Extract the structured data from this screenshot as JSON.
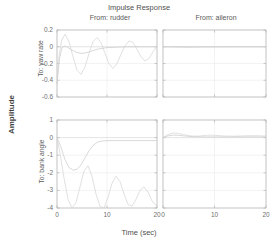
{
  "chart_data": {
    "type": "line",
    "title": "Impulse Response",
    "xlabel": "Time (sec)",
    "ylabel": "Amplitude",
    "grid": true,
    "legend": "none",
    "layout": "2x2 grid of subplots (MATLAB impulse response matrix)",
    "column_headers": [
      "From: rudder",
      "From: aileron"
    ],
    "row_headers": [
      "To: yaw rate",
      "To: bank angle"
    ],
    "xlim": [
      0,
      20
    ],
    "xticks": [
      "0",
      "10",
      "20"
    ],
    "xtick_values": [
      0,
      10,
      20
    ],
    "subplots": [
      {
        "row_label": "To: yaw rate",
        "col_label": "From: rudder",
        "ylim": [
          -0.6,
          0.2
        ],
        "yticks": [
          "0.2",
          "0",
          "-0.2",
          "-0.4",
          "-0.6"
        ],
        "ytick_values": [
          0.2,
          0,
          -0.2,
          -0.4,
          -0.6
        ],
        "series": [
          {
            "name": "dutch-roll-oscillatory",
            "x": [
              0,
              0.4,
              0.9,
              1.6,
              2.4,
              3.2,
              4.0,
              4.8,
              5.6,
              6.4,
              7.2,
              8.0,
              8.8,
              9.6,
              10.4,
              11.2,
              12.0,
              12.8,
              13.6,
              14.4,
              15.2,
              16.0,
              16.8,
              17.6,
              18.4,
              19.2,
              20.0
            ],
            "y": [
              -0.44,
              -0.12,
              0.07,
              0.15,
              0.06,
              -0.12,
              -0.28,
              -0.33,
              -0.24,
              -0.08,
              0.06,
              0.11,
              0.05,
              -0.08,
              -0.2,
              -0.26,
              -0.2,
              -0.09,
              0.01,
              0.07,
              0.05,
              -0.03,
              -0.12,
              -0.17,
              -0.14,
              -0.06,
              0.0
            ]
          },
          {
            "name": "damped-settling",
            "x": [
              0,
              0.5,
              1.0,
              1.6,
              2.2,
              3.0,
              4.0,
              5.0,
              6.0,
              7.0,
              8.0,
              9.0,
              10.0,
              12.0,
              14.0,
              16.0,
              18.0,
              20.0
            ],
            "y": [
              -0.44,
              -0.14,
              -0.01,
              0.01,
              -0.01,
              -0.04,
              -0.07,
              -0.08,
              -0.07,
              -0.05,
              -0.03,
              -0.02,
              -0.01,
              -0.005,
              0.0,
              0.0,
              0.0,
              0.0
            ]
          }
        ]
      },
      {
        "row_label": "To: yaw rate",
        "col_label": "From: aileron",
        "ylim": [
          -0.6,
          0.2
        ],
        "yticks": [
          "0.2",
          "0",
          "-0.2",
          "-0.4",
          "-0.6"
        ],
        "ytick_values": [
          0.2,
          0,
          -0.2,
          -0.4,
          -0.6
        ],
        "series": [
          {
            "name": "near-zero-response",
            "x": [
              0,
              2,
              4,
              6,
              8,
              10,
              12,
              14,
              16,
              18,
              20
            ],
            "y": [
              0.0,
              -0.005,
              -0.008,
              -0.006,
              -0.003,
              -0.002,
              -0.001,
              0.0,
              0.0,
              0.0,
              0.0
            ]
          },
          {
            "name": "near-zero-response-2",
            "x": [
              0,
              2,
              4,
              6,
              8,
              10,
              12,
              14,
              16,
              18,
              20
            ],
            "y": [
              0.0,
              0.002,
              0.001,
              0.0,
              0.0,
              0.0,
              0.0,
              0.0,
              0.0,
              0.0,
              0.0
            ]
          }
        ]
      },
      {
        "row_label": "To: bank angle",
        "col_label": "From: rudder",
        "ylim": [
          -4,
          1
        ],
        "yticks": [
          "1",
          "0",
          "-1",
          "-2",
          "-3",
          "-4"
        ],
        "ytick_values": [
          1,
          0,
          -1,
          -2,
          -3,
          -4
        ],
        "series": [
          {
            "name": "large-oscillation",
            "x": [
              0,
              0.6,
              1.4,
              2.2,
              3.0,
              3.8,
              4.6,
              5.4,
              6.2,
              7.0,
              7.8,
              8.6,
              9.4,
              10.2,
              11.0,
              11.8,
              12.6,
              13.4,
              14.2,
              15.0,
              15.8,
              16.6,
              17.4,
              18.2,
              19.0,
              20.0
            ],
            "y": [
              0.0,
              -0.9,
              -2.3,
              -3.5,
              -4.0,
              -3.7,
              -2.8,
              -1.9,
              -1.6,
              -2.2,
              -3.2,
              -3.9,
              -4.0,
              -3.4,
              -2.6,
              -2.2,
              -2.5,
              -3.2,
              -3.8,
              -3.9,
              -3.5,
              -3.0,
              -2.8,
              -3.1,
              -3.6,
              -3.9
            ]
          },
          {
            "name": "settling-response",
            "x": [
              0,
              0.8,
              1.6,
              2.4,
              3.2,
              4.0,
              4.8,
              5.6,
              6.4,
              7.2,
              8.0,
              8.8,
              9.6,
              10.4,
              12.0,
              14.0,
              16.0,
              18.0,
              20.0
            ],
            "y": [
              0.0,
              -0.55,
              -1.25,
              -1.7,
              -1.85,
              -1.8,
              -1.55,
              -1.15,
              -0.75,
              -0.45,
              -0.27,
              -0.2,
              -0.18,
              -0.17,
              -0.17,
              -0.17,
              -0.17,
              -0.17,
              -0.17
            ]
          }
        ]
      },
      {
        "row_label": "To: bank angle",
        "col_label": "From: aileron",
        "ylim": [
          -4,
          1
        ],
        "yticks": [
          "1",
          "0",
          "-1",
          "-2",
          "-3",
          "-4"
        ],
        "ytick_values": [
          1,
          0,
          -1,
          -2,
          -3,
          -4
        ],
        "series": [
          {
            "name": "small-positive-response",
            "x": [
              0,
              1,
              2,
              3,
              4,
              5,
              6,
              7,
              8,
              9,
              10,
              12,
              14,
              16,
              18,
              20
            ],
            "y": [
              0.0,
              0.18,
              0.26,
              0.24,
              0.17,
              0.11,
              0.08,
              0.09,
              0.12,
              0.14,
              0.13,
              0.09,
              0.08,
              0.1,
              0.11,
              0.09
            ]
          },
          {
            "name": "small-positive-response-2",
            "x": [
              0,
              1,
              2,
              3,
              4,
              5,
              6,
              8,
              10,
              12,
              14,
              16,
              18,
              20
            ],
            "y": [
              0.0,
              0.1,
              0.14,
              0.13,
              0.1,
              0.07,
              0.05,
              0.04,
              0.04,
              0.04,
              0.04,
              0.04,
              0.04,
              0.04
            ]
          }
        ]
      }
    ]
  },
  "colors": {
    "line": "#d8d8d8",
    "line2": "#cfcfcf",
    "axis": "#b4b4b4",
    "grid": "#e6e6e6",
    "text": "#5a5a5a"
  }
}
